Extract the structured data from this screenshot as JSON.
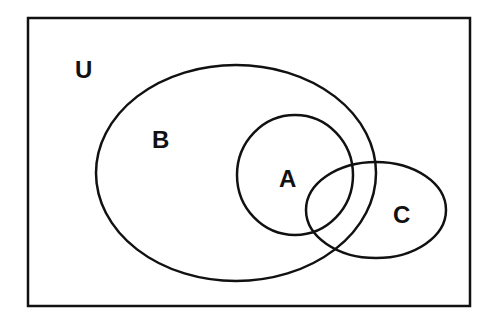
{
  "diagram": {
    "type": "venn",
    "colors": {
      "stroke": "#111111",
      "background": "#ffffff"
    },
    "universe": {
      "label": "U",
      "x": 28,
      "y": 18,
      "width": 442,
      "height": 288
    },
    "sets": [
      {
        "label": "B",
        "cx": 236,
        "cy": 173,
        "rx": 140,
        "ry": 108
      },
      {
        "label": "A",
        "cx": 295,
        "cy": 175,
        "rx": 58,
        "ry": 60
      },
      {
        "label": "C",
        "cx": 376,
        "cy": 210,
        "rx": 70,
        "ry": 48
      }
    ],
    "labels": {
      "U": "U",
      "B": "B",
      "A": "A",
      "C": "C"
    }
  }
}
